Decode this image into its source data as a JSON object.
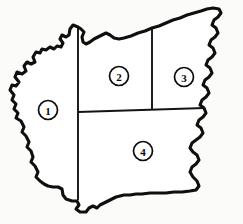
{
  "figure": {
    "kind": "region-map",
    "title": "",
    "background_color": "#fbfbfa",
    "outline_color": "#100f0d",
    "divider_color": "#141312",
    "fill_color": "#ffffff"
  },
  "map": {
    "description": "Outlined land area subdivided into four numbered regions by straight internal boundaries; left and right edges are irregular river-like boundaries.",
    "regions": [
      {
        "id": "region-1",
        "label": "1",
        "position": "west",
        "label_x": 48,
        "label_y": 110
      },
      {
        "id": "region-2",
        "label": "2",
        "position": "north-center",
        "label_x": 119,
        "label_y": 76
      },
      {
        "id": "region-3",
        "label": "3",
        "position": "north-east",
        "label_x": 184,
        "label_y": 77
      },
      {
        "id": "region-4",
        "label": "4",
        "position": "south-center",
        "label_x": 143,
        "label_y": 151
      }
    ],
    "label_circle_radius": 9.5
  },
  "geometry": {
    "outline_path": "M 78 27 L 73 25 L 70 29 L 69 35 L 66 37 L 62 35 L 60 39 L 63 43 L 61 47 L 57 46 L 54 49 L 50 47 L 46 50 L 42 49 L 40 53 L 36 52 L 33 57 L 35 62 L 31 64 L 27 62 L 24 66 L 26 71 L 22 74 L 17 72 L 15 77 L 19 82 L 16 86 L 12 85 L 10 90 L 14 95 L 12 100 L 16 104 L 14 109 L 18 113 L 16 118 L 21 121 L 24 127 L 22 132 L 26 136 L 29 142 L 27 147 L 31 151 L 33 157 L 31 162 L 35 166 L 38 172 L 36 177 L 40 181 L 44 184 L 48 186 L 53 187 L 58 187 L 62 189 L 63 195 L 66 199 L 72 201 L 77 201 L 79 205 L 76 209 L 80 212 L 86 212 L 89 208 L 93 206 L 97 208 L 100 205 L 104 203 L 108 201 L 112 199 L 116 197 L 120 196 L 124 195 L 130 195 L 136 194 L 142 194 L 150 193 L 158 193 L 166 193 L 174 192 L 182 192 L 190 191 L 196 190 L 199 186 L 197 181 L 193 177 L 190 172 L 192 167 L 196 164 L 199 160 L 197 155 L 193 152 L 190 148 L 192 143 L 196 140 L 200 137 L 203 133 L 201 128 L 197 125 L 199 120 L 203 117 L 206 113 L 204 108 L 200 105 L 202 100 L 206 97 L 209 93 L 207 88 L 203 85 L 205 80 L 209 77 L 212 73 L 210 68 L 206 65 L 208 60 L 212 57 L 215 53 L 213 48 L 209 45 L 211 40 L 215 37 L 218 33 L 216 28 L 212 25 L 214 20 L 218 17 L 221 13 L 219 9 L 213 8 L 207 9 L 201 11 L 194 13 L 187 15 L 180 18 L 173 20 L 166 23 L 159 26 L 152 28 L 145 31 L 138 33 L 131 36 L 124 38 L 119 39 L 114 38 L 110 35 L 106 33 L 102 35 L 98 37 L 94 39 L 90 42 L 86 44 L 83 42 L 82 37 L 84 32 L 81 29 Z",
    "divider_vertical_west": "M 78 27 L 78 200",
    "divider_horizontal": "M 78 112 L 205 108",
    "divider_vertical_mid": "M 152 29 L 152 110"
  }
}
